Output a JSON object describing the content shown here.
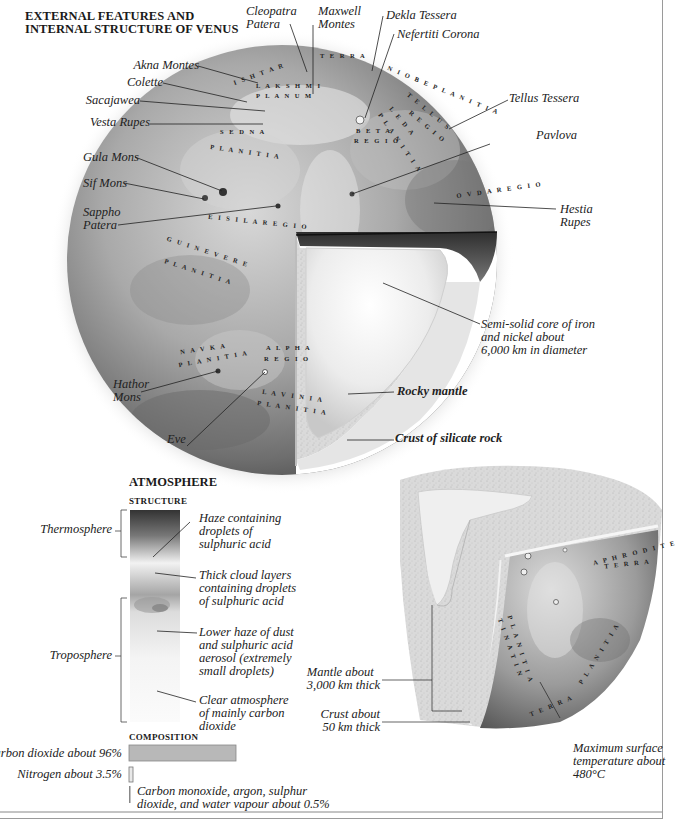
{
  "title": {
    "line1": "EXTERNAL FEATURES AND",
    "line2": "INTERNAL STRUCTURE OF VENUS"
  },
  "globe": {
    "labels": {
      "cleopatra": [
        "Cleopatra",
        "Patera"
      ],
      "maxwell": [
        "Maxwell",
        "Montes"
      ],
      "dekla": "Dekla Tessera",
      "nefertiti": "Nefertiti Corona",
      "akna": "Akna Montes",
      "colette": "Colette",
      "sacajawea": "Sacajawea",
      "vesta": "Vesta Rupes",
      "tellus": "Tellus Tessera",
      "pavlova": "Pavlova",
      "gula": "Gula Mons",
      "sif": "Sif Mons",
      "sappho": [
        "Sappho",
        "Patera"
      ],
      "hestia": [
        "Hestia",
        "Rupes"
      ],
      "core": [
        "Semi-solid core of iron",
        "and nickel about",
        "6,000 km in diameter"
      ],
      "hathor": [
        "Hathor",
        "Mons"
      ],
      "mantle": "Rocky mantle",
      "eve": "Eve",
      "crust": "Crust of silicate rock"
    },
    "map_text": {
      "ishtar": "I S H T A R",
      "terra": "T E R R A",
      "lakshmi": "L A K S H M I",
      "planum": "P L A N U M",
      "niobe": "N I O B E   P L A N I T I A",
      "tellus_regio1": "T E L L U S",
      "tellus_regio2": "R E G I O",
      "leda1": "L E D A",
      "leda2": "P L A N I T I A",
      "beta1": "B E T A",
      "beta2": "R E G I O",
      "sedna1": "S E D N A",
      "sedna2": "P L A N I T I A",
      "ovda": "O V D A   R E G I O",
      "eisila": "E I S I L A   R E G I O",
      "guinevere1": "G U I N E V E R E",
      "guinevere2": "P L A N I T I A",
      "navka1": "N A V K A",
      "navka2": "P L A N I T I A",
      "alpha1": "A L P H A",
      "alpha2": "R E G I O",
      "lavinia1": "L A V I N I A",
      "lavinia2": "P L A N I T I A"
    }
  },
  "atmosphere": {
    "heading": "ATMOSPHERE",
    "structure_heading": "STRUCTURE",
    "layers": {
      "thermosphere": "Thermosphere",
      "troposphere": "Troposphere"
    },
    "notes": {
      "haze": [
        "Haze containing",
        "droplets of",
        "sulphuric acid"
      ],
      "clouds": [
        "Thick cloud layers",
        "containing droplets",
        "of sulphuric acid"
      ],
      "lower_haze": [
        "Lower haze of dust",
        "and sulphuric acid",
        "aerosol (extremely",
        "small droplets)"
      ],
      "clear": [
        "Clear atmosphere",
        "of mainly carbon",
        "dioxide"
      ]
    },
    "composition_heading": "COMPOSITION",
    "composition": [
      {
        "label": "Carbon dioxide about 96%",
        "percent": 96
      },
      {
        "label": "Nitrogen about 3.5%",
        "percent": 3.5
      },
      {
        "label": [
          "Carbon monoxide, argon, sulphur",
          "dioxide, and water vapour about 0.5%"
        ],
        "percent": 0.5
      }
    ]
  },
  "cutaway": {
    "mantle": [
      "Mantle about",
      "3,000 km thick"
    ],
    "crust": [
      "Crust about",
      "50 km thick"
    ],
    "temperature": [
      "Maximum surface",
      "temperature about",
      "480°C"
    ],
    "map_text": {
      "aphrodite1": "A P H R O D I T E",
      "aphrodite2": "T E R R A",
      "tinatin1": "T I N A T I N",
      "tinatin2": "P L A N I T I A",
      "zhibek": "P L A N I T I A",
      "terra": "T E R R A"
    }
  },
  "colors": {
    "bar_co2": "#b8b8b8",
    "line": "#222222",
    "frame": "#9a9a9a"
  }
}
